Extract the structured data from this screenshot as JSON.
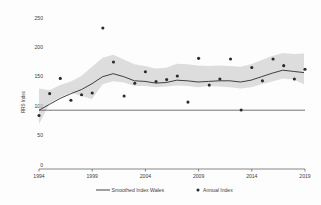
{
  "chart_data": {
    "type": "scatter",
    "title": "",
    "xlabel": "",
    "ylabel": "RRS Index",
    "xlim": [
      1994,
      2019
    ],
    "ylim": [
      0,
      250
    ],
    "grid": false,
    "legend_position": "bottom",
    "y_ticks": [
      "0",
      "50",
      "100",
      "150",
      "200",
      "250"
    ],
    "y_tick_values": [
      0,
      50,
      100,
      150,
      200,
      250
    ],
    "x_ticks": [
      "1994",
      "1999",
      "2004",
      "2009",
      "2014",
      "2019"
    ],
    "x_tick_values": [
      1994,
      1999,
      2004,
      2009,
      2014,
      2019
    ],
    "reference_line_value": 100,
    "x": [
      1994,
      1995,
      1996,
      1997,
      1998,
      1999,
      2000,
      2001,
      2002,
      2003,
      2004,
      2005,
      2006,
      2007,
      2008,
      2009,
      2010,
      2011,
      2012,
      2013,
      2014,
      2015,
      2016,
      2017,
      2018,
      2019
    ],
    "series": [
      {
        "name": "Annual Index",
        "marker": "dot",
        "values": [
          88,
          124,
          149,
          113,
          122,
          125,
          232,
          176,
          120,
          141,
          160,
          144,
          147,
          153,
          110,
          182,
          138,
          148,
          181,
          97,
          167,
          145,
          181,
          170,
          148,
          164
        ]
      },
      {
        "name": "Smoothed Index Wales",
        "marker": "line",
        "values": [
          100,
          110,
          120,
          128,
          135,
          145,
          157,
          162,
          157,
          150,
          149,
          146,
          147,
          151,
          150,
          148,
          149,
          150,
          150,
          148,
          151,
          157,
          163,
          168,
          166,
          164
        ]
      },
      {
        "name": "Smoothed Index Wales CI upper",
        "marker": "band",
        "values": [
          129,
          126,
          135,
          141,
          150,
          166,
          181,
          186,
          178,
          170,
          167,
          163,
          164,
          171,
          170,
          168,
          167,
          168,
          167,
          166,
          170,
          177,
          184,
          189,
          187,
          188
        ]
      },
      {
        "name": "Smoothed Index Wales CI lower",
        "marker": "band",
        "values": [
          72,
          96,
          106,
          115,
          121,
          126,
          134,
          139,
          137,
          131,
          131,
          129,
          130,
          132,
          131,
          129,
          131,
          132,
          133,
          131,
          133,
          138,
          143,
          147,
          145,
          137
        ]
      }
    ],
    "legend": [
      {
        "label": "Smoothed Index Wales",
        "glyph": "line-glyph"
      },
      {
        "label": "Annual Index",
        "glyph": "dot-glyph"
      }
    ]
  },
  "colors": {
    "line": "#2e2e2e",
    "band": "#c9c9c9",
    "point": "#2b2b2b",
    "axis": "#555555",
    "text": "#3c3c3c",
    "background": "#fdfdfd"
  }
}
